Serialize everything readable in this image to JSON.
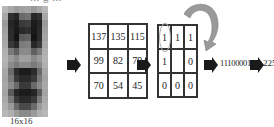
{
  "top_caption_fragment": "... g ...",
  "face": {
    "label": "16x16",
    "pixels": [
      "#b8b8b8",
      "#a8a8a8",
      "#9a9a9a",
      "#a0a0a0",
      "#a4a4a4",
      "#9a9a9a",
      "#a8a8a8",
      "#b8b8b8",
      "#a8a8a8",
      "#303030",
      "#252525",
      "#6a6a6a",
      "#707070",
      "#282828",
      "#303030",
      "#a8a8a8",
      "#9a9a9a",
      "#252525",
      "#1c1c1c",
      "#3a3a3a",
      "#404040",
      "#1c1c1c",
      "#252525",
      "#9a9a9a",
      "#a0a0a0",
      "#2a2a2a",
      "#1a1a1a",
      "#2a2a2a",
      "#303030",
      "#1a1a1a",
      "#2a2a2a",
      "#a0a0a0",
      "#a4a4a4",
      "#2c2c2c",
      "#141414",
      "#5a5a5a",
      "#606060",
      "#141414",
      "#2c2c2c",
      "#a4a4a4",
      "#a8a8a8",
      "#3a3a3a",
      "#282828",
      "#7a7a7a",
      "#808080",
      "#282828",
      "#3a3a3a",
      "#a8a8a8",
      "#b0b0b0",
      "#7a7a7a",
      "#606060",
      "#8a8a8a",
      "#8a8a8a",
      "#606060",
      "#7a7a7a",
      "#b0b0b0",
      "#b4b4b4",
      "#9a9a9a",
      "#8a8a8a",
      "#a0a0a0",
      "#a0a0a0",
      "#8a8a8a",
      "#9a9a9a",
      "#b4b4b4",
      "#b0b0b0",
      "#8a8a8a",
      "#7a7a7a",
      "#8a8a8a",
      "#8a8a8a",
      "#7a7a7a",
      "#8a8a8a",
      "#b0b0b0",
      "#a8a8a8",
      "#6a6a6a",
      "#2c2c2c",
      "#1c1c1c",
      "#1c1c1c",
      "#2c2c2c",
      "#6a6a6a",
      "#a8a8a8",
      "#a4a4a4",
      "#7a7a7a",
      "#3a3a3a",
      "#2a2a2a",
      "#2a2a2a",
      "#3a3a3a",
      "#7a7a7a",
      "#a4a4a4",
      "#a8a8a8",
      "#8a8a8a",
      "#6a6a6a",
      "#3a3a3a",
      "#3a3a3a",
      "#6a6a6a",
      "#8a8a8a",
      "#a8a8a8",
      "#a4a4a4",
      "#5a5a5a",
      "#252525",
      "#1c1c1c",
      "#1c1c1c",
      "#252525",
      "#5a5a5a",
      "#a4a4a4",
      "#aaaaaa",
      "#7a7a7a",
      "#3a3a3a",
      "#2a2a2a",
      "#2a2a2a",
      "#3a3a3a",
      "#7a7a7a",
      "#aaaaaa",
      "#b0b0b0",
      "#9a9a9a",
      "#6a6a6a",
      "#4a4a4a",
      "#4a4a4a",
      "#6a6a6a",
      "#9a9a9a",
      "#b0b0b0",
      "#b8b8b8",
      "#b0b0b0",
      "#9a9a9a",
      "#8a8a8a",
      "#8a8a8a",
      "#9a9a9a",
      "#b0b0b0",
      "#b8b8b8"
    ]
  },
  "grid_intensity": {
    "rows": [
      [
        "137",
        "135",
        "115"
      ],
      [
        "99",
        "82",
        "79"
      ],
      [
        "70",
        "54",
        "45"
      ]
    ]
  },
  "grid_binary": {
    "rows": [
      [
        "1",
        "1",
        "1"
      ],
      [
        "1",
        "",
        "0"
      ],
      [
        "0",
        "0",
        "0"
      ]
    ]
  },
  "binary_code": "11100001",
  "decimal_result": "225",
  "colors": {
    "arrow": "#1a1a1a",
    "curved_arrow": "#9a9a9a",
    "grid_border": "#333333"
  }
}
